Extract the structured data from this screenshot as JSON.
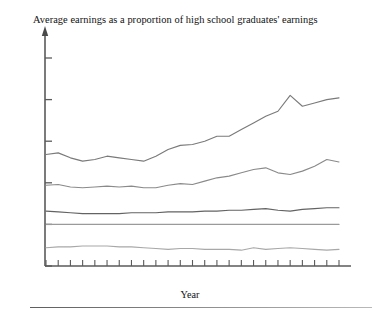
{
  "chart_data": {
    "type": "line",
    "title": "Average earnings as a proportion of high school graduates' earnings",
    "xlabel": "Year",
    "ylabel": "",
    "xlim": [
      1975,
      1999
    ],
    "ylim": [
      0.5,
      3.0
    ],
    "yticks": [
      "3.0",
      "2.5",
      "2.0",
      "1.5",
      "1.0",
      "0.5"
    ],
    "ytick_values": [
      3.0,
      2.5,
      2.0,
      1.5,
      1.0,
      0.5
    ],
    "xticks": [
      "1975",
      "1977",
      "1979",
      "1981",
      "1983",
      "1985",
      "1987",
      "1989",
      "1991",
      "1993",
      "1995",
      "1997",
      "1999"
    ],
    "xtick_values": [
      1975,
      1977,
      1979,
      1981,
      1983,
      1985,
      1987,
      1989,
      1991,
      1993,
      1995,
      1997,
      1999
    ],
    "minor_tick_interval": 1,
    "grid": false,
    "legend": "inline-labels",
    "x": [
      1975,
      1976,
      1977,
      1978,
      1979,
      1980,
      1981,
      1982,
      1983,
      1984,
      1985,
      1986,
      1987,
      1988,
      1989,
      1990,
      1991,
      1992,
      1993,
      1994,
      1995,
      1996,
      1997,
      1998,
      1999
    ],
    "series": [
      {
        "name": "Advanced degree",
        "color": "#7a7a7a",
        "label_x": 186,
        "label_y": 105,
        "values": [
          1.84,
          1.86,
          1.8,
          1.76,
          1.78,
          1.82,
          1.8,
          1.78,
          1.76,
          1.82,
          1.9,
          1.95,
          1.96,
          2.0,
          2.06,
          2.06,
          2.14,
          2.22,
          2.3,
          2.36,
          2.55,
          2.42,
          2.46,
          2.5,
          2.52
        ]
      },
      {
        "name": "Bachelor's degree",
        "color": "#8a8a8a",
        "label_x": 203,
        "label_y": 158,
        "values": [
          1.47,
          1.48,
          1.45,
          1.44,
          1.45,
          1.46,
          1.45,
          1.46,
          1.44,
          1.44,
          1.47,
          1.49,
          1.48,
          1.52,
          1.56,
          1.58,
          1.62,
          1.66,
          1.68,
          1.62,
          1.6,
          1.64,
          1.7,
          1.78,
          1.75
        ]
      },
      {
        "name": "Some college or associate's degree",
        "color": "#636363",
        "label_x": 172,
        "label_y": 196,
        "values": [
          1.16,
          1.15,
          1.14,
          1.13,
          1.13,
          1.13,
          1.13,
          1.14,
          1.14,
          1.14,
          1.15,
          1.15,
          1.15,
          1.16,
          1.16,
          1.17,
          1.17,
          1.18,
          1.19,
          1.17,
          1.16,
          1.18,
          1.19,
          1.2,
          1.2
        ]
      },
      {
        "name": "High school graduate",
        "color": "#9a9a9a",
        "label_x": 176,
        "label_y": 212,
        "values": [
          1.0,
          1.0,
          1.0,
          1.0,
          1.0,
          1.0,
          1.0,
          1.0,
          1.0,
          1.0,
          1.0,
          1.0,
          1.0,
          1.0,
          1.0,
          1.0,
          1.0,
          1.0,
          1.0,
          1.0,
          1.0,
          1.0,
          1.0,
          1.0,
          1.0
        ]
      },
      {
        "name": "Not high school graduate",
        "color": "#a8a8a8",
        "label_x": 222,
        "label_y": 232,
        "values": [
          0.72,
          0.73,
          0.73,
          0.74,
          0.74,
          0.74,
          0.73,
          0.73,
          0.72,
          0.71,
          0.7,
          0.71,
          0.71,
          0.7,
          0.7,
          0.7,
          0.69,
          0.72,
          0.7,
          0.71,
          0.72,
          0.71,
          0.7,
          0.69,
          0.7
        ]
      }
    ]
  },
  "axis": {
    "x_axis_name": "Year"
  }
}
